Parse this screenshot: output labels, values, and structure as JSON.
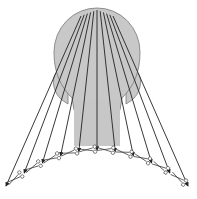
{
  "figure": {
    "colors": {
      "head_fill": "#c8c8c8",
      "head_stroke": "#777777",
      "ray": "#222222",
      "scissors": "#333333",
      "background": "#ffffff"
    },
    "ray_count": 11,
    "scissors_count": 10,
    "caption": ""
  }
}
